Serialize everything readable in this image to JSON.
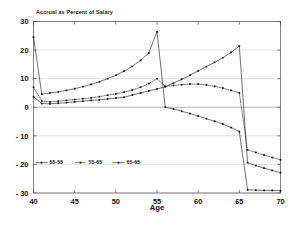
{
  "chart_data": {
    "type": "line",
    "title": "Accrual as Percent of Salary",
    "xlabel": "Age",
    "ylabel": "",
    "xlim": [
      40,
      70
    ],
    "ylim": [
      -30,
      30
    ],
    "xticks": [
      40,
      45,
      50,
      55,
      60,
      65,
      70
    ],
    "yticks": [
      30,
      20,
      10,
      0,
      -10,
      -20,
      -30
    ],
    "xtick_labels": [
      "40",
      "45",
      "50",
      "55",
      "60",
      "65",
      "70"
    ],
    "ytick_labels": [
      "30",
      "20",
      "10",
      "0",
      "- 10",
      "- 20",
      "- 30"
    ],
    "grid": true,
    "legend_position": "lower left",
    "x": [
      40,
      41,
      42,
      43,
      44,
      45,
      46,
      47,
      48,
      49,
      50,
      51,
      52,
      53,
      54,
      55,
      56,
      57,
      58,
      59,
      60,
      61,
      62,
      63,
      64,
      65,
      66,
      67,
      68,
      69,
      70
    ],
    "series": [
      {
        "name": "55-55",
        "marker": "square",
        "linestyle": "solid",
        "values": [
          3.7,
          1.3,
          1.2,
          1.4,
          1.6,
          1.9,
          2.1,
          2.4,
          2.6,
          2.9,
          3.2,
          3.5,
          4.3,
          5.0,
          5.7,
          6.4,
          7.2,
          8.4,
          9.8,
          11.2,
          12.7,
          14.2,
          15.7,
          17.3,
          19.2,
          21.4,
          -19.4,
          -20.4,
          -21.3,
          -22.1,
          -22.9
        ]
      },
      {
        "name": "55-65",
        "marker": "square",
        "linestyle": "dotted",
        "values": [
          7.0,
          2.2,
          1.9,
          2.1,
          2.4,
          2.7,
          3.0,
          3.3,
          3.7,
          4.2,
          4.7,
          5.3,
          6.0,
          7.0,
          8.3,
          10.0,
          7.3,
          7.6,
          7.9,
          8.1,
          8.1,
          7.8,
          7.3,
          6.7,
          5.9,
          5.0,
          -14.9,
          -15.8,
          -16.7,
          -17.6,
          -18.4
        ]
      },
      {
        "name": "65-65",
        "marker": "square",
        "linestyle": "solid",
        "values": [
          24.6,
          4.6,
          5.0,
          5.4,
          5.9,
          6.5,
          7.2,
          8.0,
          8.9,
          10.0,
          11.2,
          12.6,
          14.3,
          16.4,
          19.0,
          26.4,
          0.0,
          -0.6,
          -1.4,
          -2.2,
          -3.1,
          -4.0,
          -4.9,
          -5.9,
          -7.1,
          -8.5,
          -28.9,
          -29.0,
          -29.1,
          -29.1,
          -29.2
        ]
      }
    ]
  },
  "legend": {
    "entries": [
      {
        "label": "55-55",
        "style": "solid-marker"
      },
      {
        "label": "55-65",
        "style": "dotted-marker"
      },
      {
        "label": "65-65",
        "style": "solid-marker"
      }
    ]
  }
}
